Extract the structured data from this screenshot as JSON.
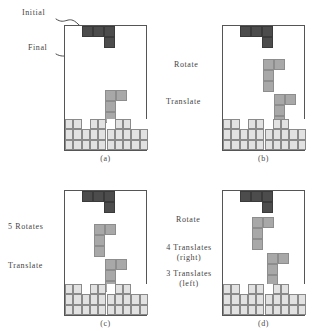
{
  "figure": {
    "type": "tetris-action-diagram",
    "board": {
      "columns": 10,
      "stack_rows": 3
    },
    "pieces": {
      "initial_color": "#4c4c4c",
      "final_color": "#a8a8a8",
      "stack_color": "#e2e2e2",
      "initial_shape": "J-horizontal",
      "final_shape": "J-vertical"
    },
    "panels": [
      {
        "id": "a",
        "caption": "(a)",
        "labels": [
          {
            "name": "initial-label",
            "text": "Initial"
          },
          {
            "name": "final-label",
            "text": "Final"
          }
        ],
        "stack_top_row": [
          1,
          1,
          0,
          1,
          1,
          0,
          1,
          1,
          0,
          0
        ],
        "stack_mid_row": [
          1,
          1,
          1,
          1,
          1,
          1,
          1,
          1,
          1,
          1
        ],
        "stack_bot_row": [
          1,
          1,
          1,
          1,
          1,
          1,
          1,
          1,
          1,
          1
        ]
      },
      {
        "id": "b",
        "caption": "(b)",
        "labels": [
          {
            "name": "rotate-label",
            "text": "Rotate"
          },
          {
            "name": "translate-label",
            "text": "Translate"
          }
        ],
        "stack_top_row": [
          1,
          1,
          0,
          1,
          1,
          0,
          1,
          1,
          0,
          0
        ],
        "stack_mid_row": [
          1,
          1,
          1,
          1,
          1,
          1,
          1,
          1,
          1,
          1
        ],
        "stack_bot_row": [
          1,
          1,
          1,
          1,
          1,
          1,
          1,
          1,
          1,
          1
        ]
      },
      {
        "id": "c",
        "caption": "(c)",
        "labels": [
          {
            "name": "rotates-label",
            "text": "5 Rotates"
          },
          {
            "name": "translate-label",
            "text": "Translate"
          }
        ],
        "stack_top_row": [
          1,
          1,
          0,
          1,
          1,
          0,
          1,
          1,
          0,
          0
        ],
        "stack_mid_row": [
          1,
          1,
          1,
          1,
          1,
          1,
          1,
          1,
          1,
          1
        ],
        "stack_bot_row": [
          1,
          1,
          1,
          1,
          1,
          1,
          1,
          1,
          1,
          1
        ]
      },
      {
        "id": "d",
        "caption": "(d)",
        "labels": [
          {
            "name": "rotate-label",
            "text": "Rotate"
          },
          {
            "name": "translates-right-label-line1",
            "text": "4 Translates"
          },
          {
            "name": "translates-right-label-line2",
            "text": "(right)"
          },
          {
            "name": "translates-left-label-line1",
            "text": "3 Translates"
          },
          {
            "name": "translates-left-label-line2",
            "text": "(left)"
          }
        ],
        "stack_top_row": [
          1,
          1,
          0,
          1,
          1,
          0,
          1,
          1,
          0,
          0
        ],
        "stack_mid_row": [
          1,
          1,
          1,
          1,
          1,
          1,
          1,
          1,
          1,
          1
        ],
        "stack_bot_row": [
          1,
          1,
          1,
          1,
          1,
          1,
          1,
          1,
          1,
          1
        ]
      }
    ]
  }
}
